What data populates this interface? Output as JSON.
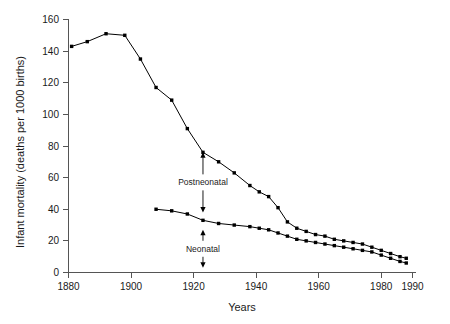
{
  "chart_data": {
    "type": "line",
    "title": "",
    "xlabel": "Years",
    "ylabel": "Infant mortality (deaths per 1000 births)",
    "xlim": [
      1875,
      1992
    ],
    "ylim": [
      0,
      165
    ],
    "xticks": [
      1880,
      1900,
      1920,
      1940,
      1960,
      1980,
      1990
    ],
    "xticklabels": [
      "1880",
      "1900",
      "1920",
      "1940",
      "1960",
      "1980",
      "1990"
    ],
    "yticks": [
      0,
      20,
      40,
      60,
      80,
      100,
      120,
      140,
      160
    ],
    "yticklabels": [
      "0",
      "20",
      "40",
      "60",
      "80",
      "100",
      "120",
      "140",
      "160"
    ],
    "grid": false,
    "legend": "none",
    "marker": "square",
    "line_color": "#000000",
    "series": [
      {
        "name": "Infant mortality (total)",
        "x": [
          1881,
          1886,
          1892,
          1898,
          1903,
          1908,
          1913,
          1918,
          1923,
          1928,
          1933,
          1938,
          1941,
          1944,
          1947,
          1950,
          1953,
          1956,
          1959,
          1962,
          1965,
          1968,
          1971,
          1974,
          1977,
          1980,
          1983,
          1986,
          1988
        ],
        "y": [
          143,
          146,
          151,
          150,
          135,
          117,
          109,
          91,
          76,
          70,
          63,
          55,
          51,
          48,
          41,
          32,
          28,
          26,
          24,
          23,
          21,
          20,
          19,
          18,
          16,
          14,
          12,
          10,
          9
        ]
      },
      {
        "name": "Neonatal mortality",
        "x": [
          1908,
          1913,
          1918,
          1923,
          1928,
          1933,
          1938,
          1941,
          1944,
          1947,
          1950,
          1953,
          1956,
          1959,
          1962,
          1965,
          1968,
          1971,
          1974,
          1977,
          1980,
          1983,
          1986,
          1988
        ],
        "y": [
          40,
          39,
          37,
          33,
          31,
          30,
          29,
          28,
          27,
          25,
          23,
          21,
          20,
          19,
          18,
          17,
          16,
          15,
          14,
          13,
          11,
          9,
          7,
          6
        ]
      }
    ],
    "annotations": [
      {
        "label": "Postneonatal",
        "x": 1923,
        "y_top": 76,
        "y_bottom": 38,
        "description": "double arrow between total and neonatal curves"
      },
      {
        "label": "Neonatal",
        "x": 1923,
        "y_top": 27,
        "y_bottom": 3,
        "description": "double arrow between neonatal curve and zero"
      }
    ]
  }
}
